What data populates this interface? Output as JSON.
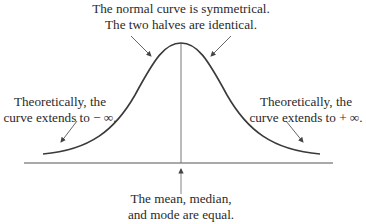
{
  "diagram": {
    "type": "normal-distribution-annotated",
    "annotations": {
      "top": {
        "line1": "The normal curve is symmetrical.",
        "line2": "The two halves are identical."
      },
      "left": {
        "line1": "Theoretically, the",
        "line2": "curve extends to − ∞."
      },
      "right": {
        "line1": "Theoretically, the",
        "line2": "curve extends to + ∞."
      },
      "bottom": {
        "line1": "The mean, median,",
        "line2": "and mode are equal."
      }
    },
    "colors": {
      "curve": "#3a3a3a",
      "axis": "#555555",
      "arrows": "#555555",
      "text": "#2a2a2a"
    }
  }
}
